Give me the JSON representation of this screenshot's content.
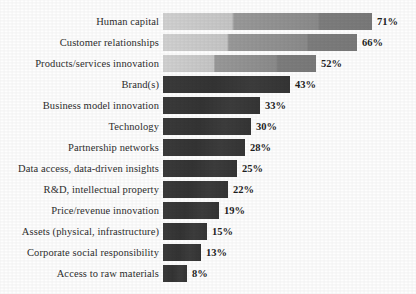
{
  "chart_data": {
    "type": "bar",
    "orientation": "horizontal",
    "title": "",
    "subtitle": "",
    "xlabel": "",
    "ylabel": "",
    "xlim": [
      0,
      71
    ],
    "grid": false,
    "legend": null,
    "value_suffix": "%",
    "categories": [
      "Human capital",
      "Customer relationships",
      "Products/services innovation",
      "Brand(s)",
      "Business model innovation",
      "Technology",
      "Partnership networks",
      "Data access, data-driven insights",
      "R&D, intellectual property",
      "Price/revenue innovation",
      "Assets (physical, infrastructure)",
      "Corporate social responsibility",
      "Access to raw materials"
    ],
    "values": [
      71,
      66,
      52,
      43,
      33,
      30,
      28,
      25,
      22,
      19,
      15,
      13,
      8
    ],
    "value_labels": [
      "71%",
      "66%",
      "52%",
      "43%",
      "33%",
      "30%",
      "28%",
      "25%",
      "22%",
      "19%",
      "15%",
      "13%",
      "8%"
    ],
    "bar_styles": [
      "light",
      "light",
      "light",
      "dark",
      "dark",
      "dark",
      "dark",
      "dark",
      "dark",
      "dark",
      "dark",
      "dark",
      "dark"
    ],
    "colors": {
      "bar_light_start": "#d2d2d2",
      "bar_light_end": "#7a7a7a",
      "bar_dark": "#3a3a3a",
      "label_text": "#2e2e2e",
      "value_text": "#1f1f1f",
      "background": "#fefefe"
    }
  }
}
